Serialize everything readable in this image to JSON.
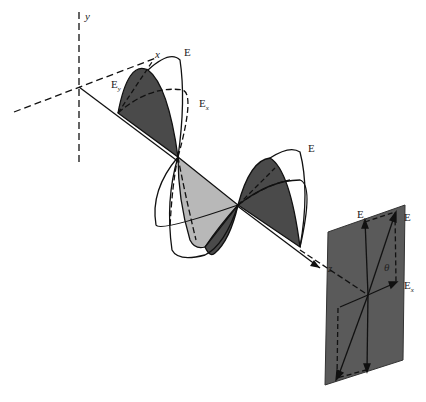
{
  "diagram": {
    "axes": {
      "x": "x",
      "y": "y",
      "z": "z"
    },
    "field_labels": {
      "E_top": "E",
      "Ey": "E",
      "Ey_sub": "y",
      "Ex": "E",
      "Ex_sub": "x",
      "E_second": "E"
    },
    "plate_labels": {
      "E": "E",
      "Ey": "E",
      "Ey_sub": "y",
      "Ex": "E",
      "Ex_sub": "x",
      "theta": "θ",
      "z": "z"
    },
    "colors": {
      "dark_lobe": "#4a4a4a",
      "light_lobe": "#b8b8b8",
      "plate": "#5a5a5a",
      "line": "#111111"
    }
  }
}
